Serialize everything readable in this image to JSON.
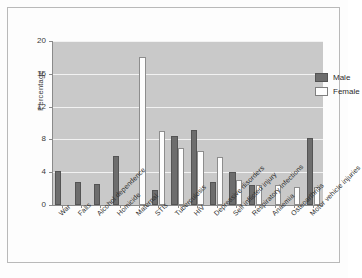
{
  "chart_data": {
    "type": "bar",
    "title": "",
    "xlabel": "",
    "ylabel": "Percentage",
    "ylim": [
      0,
      20
    ],
    "yticks": [
      0,
      4,
      8,
      12,
      16,
      20
    ],
    "grid": true,
    "legend_position": "top-right",
    "categories": [
      "War",
      "Falls",
      "Alcohol dependence",
      "Homicide",
      "Maternal",
      "STIs",
      "Tuberculosis",
      "HIV",
      "Depressive disorders",
      "Self inflicted injury",
      "Respiratory infections",
      "Anaemia",
      "Osteoarthritis",
      "Motor vehicle injuries"
    ],
    "series": [
      {
        "name": "Male",
        "color": "#6d6d6d",
        "values": [
          4.2,
          2.8,
          2.6,
          6.0,
          0,
          1.8,
          8.4,
          9.2,
          2.8,
          4.0,
          2.4,
          0,
          0,
          8.2
        ]
      },
      {
        "name": "Female",
        "color": "#fdfdfd",
        "values": [
          0,
          0,
          0,
          0,
          18.0,
          9.0,
          7.0,
          6.6,
          5.8,
          3.1,
          2.4,
          2.4,
          2.2,
          2.2
        ]
      }
    ]
  },
  "legend": {
    "items": [
      {
        "label": "Male"
      },
      {
        "label": "Female"
      }
    ]
  }
}
